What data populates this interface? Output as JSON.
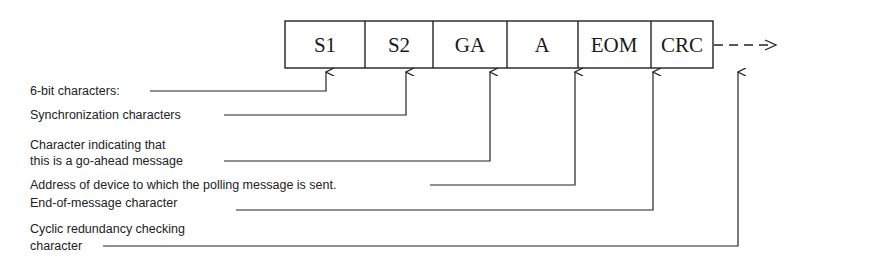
{
  "diagram": {
    "fields": [
      {
        "label": "S1",
        "x": 285,
        "w": 80
      },
      {
        "label": "S2",
        "x": 365,
        "w": 68
      },
      {
        "label": "GA",
        "x": 433,
        "w": 74
      },
      {
        "label": "A",
        "x": 507,
        "w": 71
      },
      {
        "label": "EOM",
        "x": 578,
        "w": 73
      },
      {
        "label": "CRC",
        "x": 651,
        "w": 62
      }
    ],
    "continuation": "dashed-arrow-right",
    "annotations": [
      {
        "id": "six-bit",
        "lines": [
          "6-bit characters:"
        ],
        "target": "S1"
      },
      {
        "id": "sync",
        "lines": [
          "Synchronization characters"
        ],
        "target": "S1,S2"
      },
      {
        "id": "go-ahead",
        "lines": [
          "Character indicating that",
          "this is a go-ahead message"
        ],
        "target": "GA"
      },
      {
        "id": "address",
        "lines": [
          "Address of device to which the polling message is sent."
        ],
        "target": "A"
      },
      {
        "id": "eom",
        "lines": [
          "End-of-message character"
        ],
        "target": "EOM"
      },
      {
        "id": "crc",
        "lines": [
          "Cyclic redundancy checking",
          "character"
        ],
        "target": "CRC"
      }
    ]
  }
}
